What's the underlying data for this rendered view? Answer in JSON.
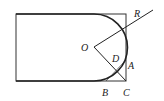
{
  "diagram": {
    "type": "geometry",
    "colors": {
      "stroke": "#222222",
      "background": "#ffffff"
    },
    "points": {
      "O": {
        "label": "O"
      },
      "D": {
        "label": "D"
      },
      "A": {
        "label": "A"
      },
      "B": {
        "label": "B"
      },
      "C": {
        "label": "C"
      },
      "R": {
        "label": "R"
      }
    }
  }
}
